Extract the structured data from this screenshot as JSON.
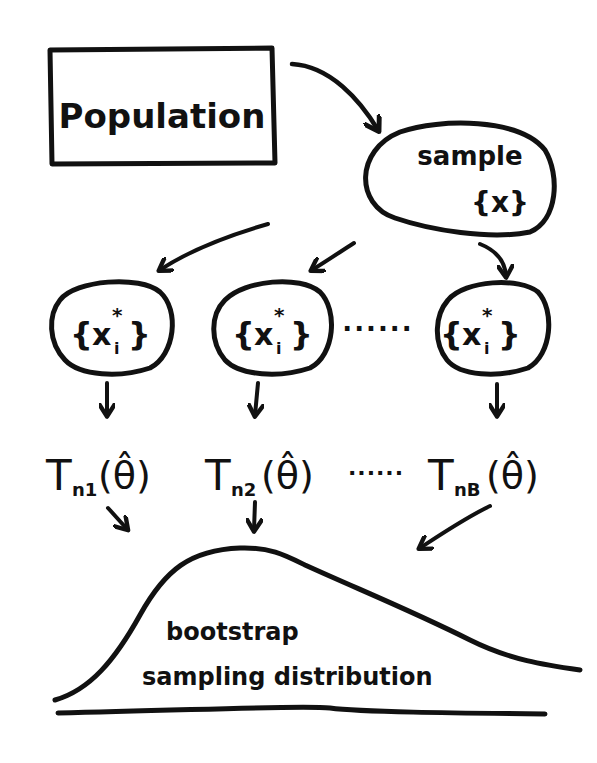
{
  "diagram": {
    "nodes": {
      "population": {
        "label": "Population"
      },
      "sample": {
        "label": "sample",
        "set": "{x}"
      },
      "resamples": [
        {
          "label": "{x*i}",
          "set_open": "{",
          "var": "x",
          "sup": "*",
          "sub": "i",
          "set_close": "}"
        },
        {
          "label": "{x*i}",
          "set_open": "{",
          "var": "x",
          "sup": "*",
          "sub": "i",
          "set_close": "}"
        },
        {
          "label": "{x*i}",
          "set_open": "{",
          "var": "x",
          "sup": "*",
          "sub": "i",
          "set_close": "}"
        }
      ],
      "resample_ellipsis": "······",
      "statistics": [
        {
          "label": "Tn1(θ̂)",
          "T": "T",
          "sub": "n1",
          "arg": "(θ̂)"
        },
        {
          "label": "Tn2(θ̂)",
          "T": "T",
          "sub": "n2",
          "arg": "(θ̂)"
        },
        {
          "label": "TnB(θ̂)",
          "T": "T",
          "sub": "nB",
          "arg": "(θ̂)"
        }
      ],
      "statistic_ellipsis": "······",
      "distribution": {
        "line1": "bootstrap",
        "line2": "sampling distribution"
      }
    },
    "edges": [
      {
        "from": "population",
        "to": "sample"
      },
      {
        "from": "sample",
        "to": "resample-1"
      },
      {
        "from": "sample",
        "to": "resample-2"
      },
      {
        "from": "sample",
        "to": "resample-B"
      },
      {
        "from": "resample-1",
        "to": "statistic-1"
      },
      {
        "from": "resample-2",
        "to": "statistic-2"
      },
      {
        "from": "resample-B",
        "to": "statistic-B"
      },
      {
        "from": "statistic-1",
        "to": "distribution"
      },
      {
        "from": "statistic-2",
        "to": "distribution"
      },
      {
        "from": "statistic-B",
        "to": "distribution"
      }
    ],
    "colors": {
      "ink": "#111111",
      "background": "#ffffff"
    }
  }
}
